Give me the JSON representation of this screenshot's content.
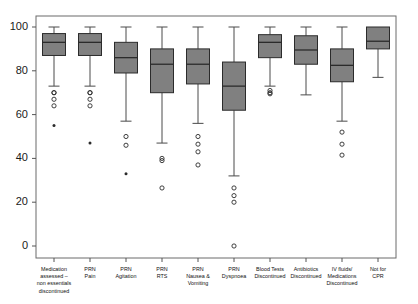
{
  "chart_data": {
    "type": "box",
    "title": "",
    "xlabel": "",
    "ylabel": "",
    "ylim": [
      0,
      104
    ],
    "grid": false,
    "legend": null,
    "y_ticks": [
      0,
      20,
      40,
      60,
      80,
      100
    ],
    "y_tick_labels": [
      "0",
      "20",
      "40",
      "60",
      "80",
      "100"
    ],
    "categories": [
      "Medication assessed – non essentials discontinued",
      "PRN Pain",
      "PRN Agitation",
      "PRN RTS",
      "PRN Nausea & Vomiting",
      "PRN Dyspnoea",
      "Blood Tests Discontinued",
      "Antibiotics Discontinued",
      "IV fluids/ Medications Discontinued",
      "Not for CPR"
    ],
    "category_label_lines": [
      [
        "Medication",
        "assessed –",
        "non essentials",
        "discontinued"
      ],
      [
        "PRN",
        "Pain"
      ],
      [
        "PRN",
        "Agitation"
      ],
      [
        "PRN",
        "RTS"
      ],
      [
        "PRN",
        "Nausea &",
        "Vomiting"
      ],
      [
        "PRN",
        "Dyspnoea"
      ],
      [
        "Blood Tests",
        "Discontinued"
      ],
      [
        "Antibiotics",
        "Discontinued"
      ],
      [
        "IV fluids/",
        "Medications",
        "Discontinued"
      ],
      [
        "Not for",
        "CPR"
      ]
    ],
    "boxes": [
      {
        "category": "Medication assessed – non essentials discontinued",
        "whisker_low": 73,
        "q1": 87,
        "median": 93,
        "q3": 97,
        "whisker_high": 100,
        "outliers": [
          70,
          70,
          67,
          64
        ],
        "far_outliers": [
          55
        ]
      },
      {
        "category": "PRN Pain",
        "whisker_low": 73,
        "q1": 87,
        "median": 93,
        "q3": 97,
        "whisker_high": 100,
        "outliers": [
          70,
          70,
          67,
          64
        ],
        "far_outliers": [
          47
        ]
      },
      {
        "category": "PRN Agitation",
        "whisker_low": 57,
        "q1": 79,
        "median": 86,
        "q3": 93,
        "whisker_high": 100,
        "outliers": [
          50,
          46
        ],
        "far_outliers": [
          33
        ]
      },
      {
        "category": "PRN RTS",
        "whisker_low": 47,
        "q1": 70,
        "median": 83,
        "q3": 90,
        "whisker_high": 100,
        "outliers": [
          40,
          39,
          26.5
        ],
        "far_outliers": []
      },
      {
        "category": "PRN Nausea & Vomiting",
        "whisker_low": 56,
        "q1": 74,
        "median": 83,
        "q3": 90,
        "whisker_high": 100,
        "outliers": [
          50,
          46.5,
          43,
          37
        ],
        "far_outliers": []
      },
      {
        "category": "PRN Dyspnoea",
        "whisker_low": 32,
        "q1": 62,
        "median": 73,
        "q3": 84,
        "whisker_high": 100,
        "outliers": [
          26.5,
          23,
          20,
          0
        ],
        "far_outliers": []
      },
      {
        "category": "Blood Tests Discontinued",
        "whisker_low": 73,
        "q1": 86,
        "median": 93,
        "q3": 96.5,
        "whisker_high": 100,
        "outliers": [
          71,
          70,
          69.5
        ],
        "far_outliers": []
      },
      {
        "category": "Antibiotics Discontinued",
        "whisker_low": 69,
        "q1": 83,
        "median": 89.5,
        "q3": 96,
        "whisker_high": 100,
        "outliers": [],
        "far_outliers": []
      },
      {
        "category": "IV fluids/ Medications Discontinued",
        "whisker_low": 57,
        "q1": 75,
        "median": 82.5,
        "q3": 90,
        "whisker_high": 100,
        "outliers": [
          52,
          46.5,
          41.5
        ],
        "far_outliers": []
      },
      {
        "category": "Not for CPR",
        "whisker_low": 77,
        "q1": 90,
        "median": 93.5,
        "q3": 100,
        "whisker_high": 100,
        "outliers": [],
        "far_outliers": []
      }
    ]
  },
  "colors": {
    "box_fill": "#808080",
    "box_stroke": "#2b2b2b",
    "frame": "#6b6b6b",
    "text": "#111111",
    "background": "#ffffff"
  }
}
